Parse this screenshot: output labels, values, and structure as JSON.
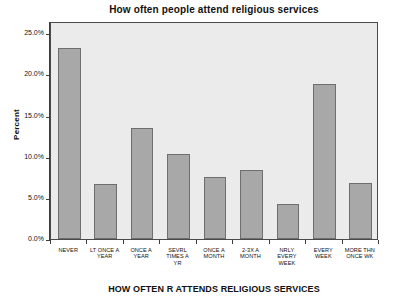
{
  "chart_data": {
    "type": "bar",
    "title": "How often people attend religious services",
    "xlabel": "HOW OFTEN R ATTENDS RELIGIOUS SERVICES",
    "ylabel": "Percent",
    "ylim": [
      0,
      26.5
    ],
    "ytick_values": [
      0,
      5,
      10,
      15,
      20,
      25
    ],
    "ytick_labels": [
      "0.0%",
      "5.0%",
      "10.0%",
      "15.0%",
      "20.0%",
      "25.0%"
    ],
    "grid": false,
    "legend": "none",
    "categories": [
      "NEVER",
      "LT ONCE A YEAR",
      "ONCE A YEAR",
      "SEVRL TIMES A YR",
      "ONCE A MONTH",
      "2-3X A MONTH",
      "NRLY EVERY WEEK",
      "EVERY WEEK",
      "MORE THN ONCE WK"
    ],
    "category_lines": [
      [
        "NEVER"
      ],
      [
        "LT ONCE A",
        "YEAR"
      ],
      [
        "ONCE A",
        "YEAR"
      ],
      [
        "SEVRL",
        "TIMES A",
        "YR"
      ],
      [
        "ONCE A",
        "MONTH"
      ],
      [
        "2-3X A",
        "MONTH"
      ],
      [
        "NRLY",
        "EVERY",
        "WEEK"
      ],
      [
        "EVERY",
        "WEEK"
      ],
      [
        "MORE THN",
        "ONCE WK"
      ]
    ],
    "values": [
      23.2,
      6.7,
      13.5,
      10.3,
      7.5,
      8.4,
      4.3,
      18.8,
      6.8
    ],
    "bar_color": "#a8a8a8",
    "bar_edge_color": "#6e6e6e",
    "plot_background": "#ebebeb",
    "axis_color": "#3c3c3c"
  }
}
